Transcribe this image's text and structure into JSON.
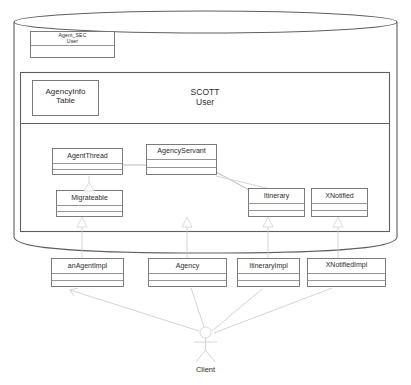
{
  "diagram": {
    "title_visible": false,
    "colors": {
      "stroke": "#7d7d7d",
      "stroke_dark": "#5a5a5a",
      "text": "#2b2b2b",
      "fill": "#ffffff",
      "background": "#ffffff"
    },
    "database": {
      "name": "database-cylinder",
      "schemas": [
        {
          "name": "agent-sec-schema",
          "label": "Agent_SEC\nUser",
          "compartments": 2
        },
        {
          "name": "scott-schema",
          "label": "SCOTT\nUser",
          "table": {
            "name": "agencyinfo-table",
            "label": "AgencyInfo\nTable"
          }
        }
      ]
    },
    "server_classes": [
      {
        "id": "agentthread",
        "label": "AgentThread",
        "stereotype": "class"
      },
      {
        "id": "agencyservant",
        "label": "AgencyServant",
        "stereotype": "class"
      },
      {
        "id": "migrateable",
        "label": "Migrateable",
        "stereotype": "class"
      },
      {
        "id": "itinerary",
        "label": "Itinerary",
        "stereotype": "class"
      },
      {
        "id": "xnotified",
        "label": "XNotified",
        "stereotype": "class"
      }
    ],
    "client_classes": [
      {
        "id": "anagentimpl",
        "label": "anAgentImpl",
        "stereotype": "class"
      },
      {
        "id": "agency",
        "label": "Agency",
        "stereotype": "class"
      },
      {
        "id": "itineraryimpl",
        "label": "ItineraryImpl",
        "stereotype": "class"
      },
      {
        "id": "xnotifiedimpl",
        "label": "XNotifiedImpl",
        "stereotype": "class"
      }
    ],
    "actor": {
      "id": "client-actor",
      "label": "Client",
      "icon": "actor-stick-figure-icon"
    },
    "relationships": [
      {
        "from": "agentthread",
        "to": "agencyservant",
        "type": "association"
      },
      {
        "from": "agencyservant",
        "to": "itinerary",
        "type": "association"
      },
      {
        "from": "anagentimpl",
        "to": "migrateable",
        "type": "generalization"
      },
      {
        "from": "agency",
        "to": "agencyservant",
        "type": "generalization"
      },
      {
        "from": "itineraryimpl",
        "to": "itinerary",
        "type": "generalization"
      },
      {
        "from": "xnotifiedimpl",
        "to": "xnotified",
        "type": "generalization"
      },
      {
        "from": "client-actor",
        "to": "anagentimpl",
        "type": "association"
      },
      {
        "from": "client-actor",
        "to": "agency",
        "type": "association"
      },
      {
        "from": "client-actor",
        "to": "itineraryimpl",
        "type": "association"
      },
      {
        "from": "client-actor",
        "to": "xnotifiedimpl",
        "type": "association"
      }
    ]
  }
}
